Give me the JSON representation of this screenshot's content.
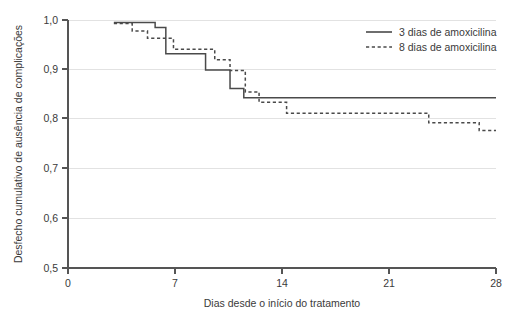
{
  "chart_data": {
    "type": "line",
    "subtype": "kaplan-meier-step",
    "title": "",
    "xlabel": "Dias desde o início do tratamento",
    "ylabel": "Desfecho cumulativo de ausência de complicações",
    "xlim": [
      0,
      28
    ],
    "ylim": [
      0.5,
      1.0
    ],
    "xticks": [
      0,
      7,
      14,
      21,
      28
    ],
    "xtick_labels": [
      "0",
      "7",
      "14",
      "21",
      "28"
    ],
    "yticks": [
      0.5,
      0.6,
      0.7,
      0.8,
      0.9,
      1.0
    ],
    "ytick_labels": [
      "0,5",
      "0,6",
      "0,7",
      "0,8",
      "0,9",
      "1,0"
    ],
    "grid": "horizontal",
    "legend_position": "top-right",
    "series": [
      {
        "name": "3 dias de amoxicilina",
        "style": "solid",
        "color": "#4a4a4a",
        "x": [
          3.0,
          3.0,
          5.7,
          5.7,
          6.4,
          6.4,
          9.0,
          9.0,
          10.5,
          10.5,
          11.5,
          11.5,
          28.0
        ],
        "y": [
          0.995,
          0.995,
          0.995,
          0.985,
          0.985,
          0.932,
          0.932,
          0.899,
          0.899,
          0.899,
          0.862,
          0.843,
          0.843
        ],
        "steps": [
          {
            "x_start": 3.0,
            "x_end": 5.7,
            "value": 0.995
          },
          {
            "x_start": 5.7,
            "x_end": 6.4,
            "value": 0.985
          },
          {
            "x_start": 6.4,
            "x_end": 9.0,
            "value": 0.932
          },
          {
            "x_start": 9.0,
            "x_end": 10.6,
            "value": 0.899
          },
          {
            "x_start": 10.6,
            "x_end": 11.5,
            "value": 0.862
          },
          {
            "x_start": 11.5,
            "x_end": 28.0,
            "value": 0.843
          }
        ]
      },
      {
        "name": "8 dias de amoxicilina",
        "style": "dashed",
        "color": "#4a4a4a",
        "steps": [
          {
            "x_start": 3.0,
            "x_end": 4.2,
            "value": 0.993
          },
          {
            "x_start": 4.2,
            "x_end": 5.2,
            "value": 0.978
          },
          {
            "x_start": 5.2,
            "x_end": 6.9,
            "value": 0.963
          },
          {
            "x_start": 6.9,
            "x_end": 9.6,
            "value": 0.941
          },
          {
            "x_start": 9.6,
            "x_end": 10.6,
            "value": 0.92
          },
          {
            "x_start": 10.6,
            "x_end": 11.6,
            "value": 0.898
          },
          {
            "x_start": 11.6,
            "x_end": 12.5,
            "value": 0.855
          },
          {
            "x_start": 12.5,
            "x_end": 14.3,
            "value": 0.834
          },
          {
            "x_start": 14.3,
            "x_end": 23.6,
            "value": 0.812
          },
          {
            "x_start": 23.6,
            "x_end": 26.9,
            "value": 0.793
          },
          {
            "x_start": 26.9,
            "x_end": 28.0,
            "value": 0.777
          }
        ]
      }
    ]
  },
  "legend": {
    "entries": [
      {
        "label": "3 dias de amoxicilina",
        "style": "solid"
      },
      {
        "label": "8 dias de amoxicilina",
        "style": "dashed"
      }
    ]
  },
  "axes": {
    "x_title": "Dias desde o início do tratamento",
    "y_title": "Desfecho cumulativo de ausência de complicações",
    "x_labels": [
      "0",
      "7",
      "14",
      "21",
      "28"
    ],
    "y_labels": [
      "1,0",
      "0,9",
      "0,8",
      "0,7",
      "0,6",
      "0,5"
    ]
  }
}
